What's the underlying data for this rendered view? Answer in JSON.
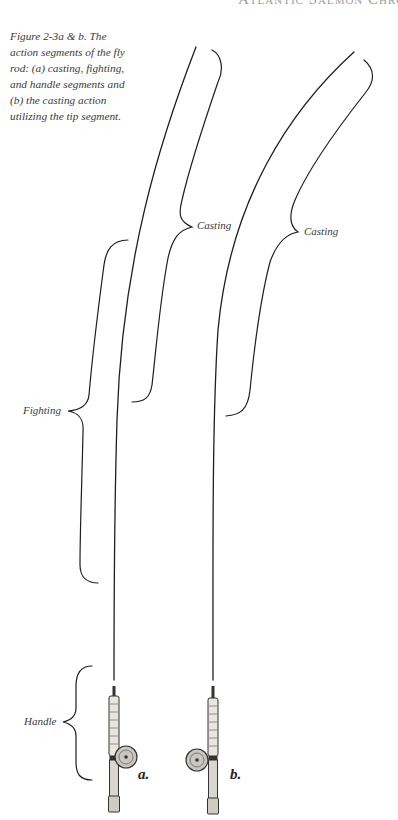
{
  "page": {
    "running_head": "Atlantic Salmon Chronicles"
  },
  "figure": {
    "caption": "Figure 2-3a & b. The action segments of the fly rod: (a) casting, fighting, and handle segments and (b) the casting action utilizing the tip segment.",
    "panels": [
      {
        "letter": "a.",
        "segments": [
          {
            "label": "Casting"
          },
          {
            "label": "Fighting"
          },
          {
            "label": "Handle"
          }
        ]
      },
      {
        "letter": "b.",
        "segments": [
          {
            "label": "Casting"
          }
        ]
      }
    ],
    "colors": {
      "line": "#1e1e1e",
      "text": "#3a3a3a"
    }
  }
}
